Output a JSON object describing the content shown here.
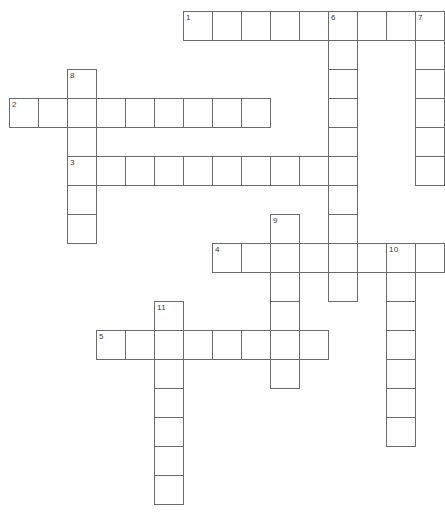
{
  "puzzle": {
    "type": "crossword-grid",
    "title": "Crossword Puzzle Grid",
    "canvas": {
      "width": 441,
      "height": 516
    },
    "geometry": {
      "cell_size": 29,
      "origin_x": 9,
      "origin_y": 11,
      "border_color": "#6b6b6b",
      "cell_fill": "#ffffff",
      "number_color": "#3a3a3a",
      "number_font_size": 8
    },
    "entry_count": 11,
    "across_count": 5,
    "down_count": 6,
    "entries": [
      {
        "number": "1",
        "direction": "across",
        "col": 6,
        "row": 0,
        "length": 9
      },
      {
        "number": "2",
        "direction": "across",
        "col": 0,
        "row": 3,
        "length": 9
      },
      {
        "number": "3",
        "direction": "across",
        "col": 2,
        "row": 5,
        "length": 9
      },
      {
        "number": "4",
        "direction": "across",
        "col": 7,
        "row": 8,
        "length": 8
      },
      {
        "number": "5",
        "direction": "across",
        "col": 3,
        "row": 11,
        "length": 8
      },
      {
        "number": "6",
        "direction": "down",
        "col": 11,
        "row": 0,
        "length": 10
      },
      {
        "number": "7",
        "direction": "down",
        "col": 14,
        "row": 0,
        "length": 6
      },
      {
        "number": "8",
        "direction": "down",
        "col": 2,
        "row": 2,
        "length": 6
      },
      {
        "number": "9",
        "direction": "down",
        "col": 9,
        "row": 7,
        "length": 6
      },
      {
        "number": "10",
        "direction": "down",
        "col": 13,
        "row": 8,
        "length": 7
      },
      {
        "number": "11",
        "direction": "down",
        "col": 5,
        "row": 10,
        "length": 7
      }
    ]
  }
}
